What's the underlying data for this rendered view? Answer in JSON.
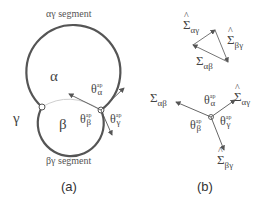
{
  "panel_a": {
    "caption": "(a)",
    "top_segment_label": "αγ segment",
    "bottom_segment_label": "βγ segment",
    "phase_alpha": "α",
    "phase_beta": "β",
    "phase_gamma": "γ",
    "theta": "θ",
    "ap": "ap",
    "alpha": "α",
    "beta": "β",
    "gamma": "γ"
  },
  "panel_b": {
    "caption": "(b)",
    "triangle": {
      "sigma": "Σ",
      "ag": "αγ",
      "bg": "βγ",
      "ab": "αβ"
    },
    "star": {
      "sigma": "Σ",
      "ab": "αβ",
      "ag": "αγ",
      "bg": "βγ",
      "theta": "θ",
      "ap": "ap",
      "alpha": "α",
      "beta": "β",
      "gamma": "γ"
    }
  },
  "colors": {
    "line": "#555555",
    "light_line": "#c8c8c8",
    "background": "#ffffff"
  }
}
